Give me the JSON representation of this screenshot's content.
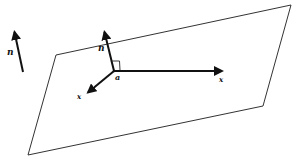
{
  "diagram": {
    "colors": {
      "stroke": "#222222",
      "plane": "#333333",
      "background": "#ffffff"
    },
    "plane": {
      "points": [
        [
          56,
          55
        ],
        [
          291,
          5
        ],
        [
          263,
          106
        ],
        [
          28,
          155
        ]
      ]
    },
    "origin": {
      "x": 114,
      "y": 71,
      "label": "a"
    },
    "vectors": [
      {
        "name": "normal-in-plane",
        "from": [
          114,
          71
        ],
        "to": [
          104,
          30
        ],
        "label": "n",
        "label_pos": [
          99,
          50
        ]
      },
      {
        "name": "x-right",
        "from": [
          114,
          71
        ],
        "to": [
          224,
          71
        ],
        "label": "x",
        "label_pos": [
          219,
          81
        ]
      },
      {
        "name": "x-down-left",
        "from": [
          114,
          71
        ],
        "to": [
          86,
          94
        ],
        "label": "x",
        "label_pos": [
          78,
          98
        ]
      },
      {
        "name": "normal-free",
        "from": [
          23,
          72
        ],
        "to": [
          14,
          30
        ],
        "label": "n",
        "label_pos": [
          7,
          54
        ]
      }
    ],
    "labels": {
      "n_free": "n",
      "n_plane": "n",
      "x_right": "x",
      "x_left": "x",
      "a": "a"
    }
  }
}
